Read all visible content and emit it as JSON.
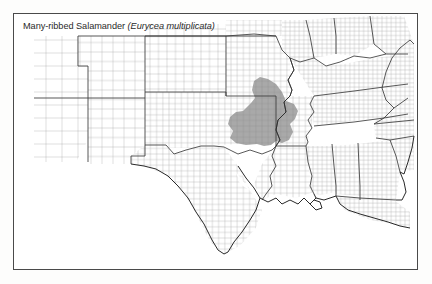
{
  "figure": {
    "caption_common": "Many-ribbed Salamander",
    "caption_scientific": "(Eurycea multiplicata)",
    "frame_color": "#4a4a4a",
    "background_color": "#ffffff"
  },
  "map": {
    "type": "species-range-map",
    "region": "south-central and southeastern United States",
    "county_fill": "#ffffff",
    "county_stroke": "#9a9a9a",
    "state_stroke": "#3a3a3a",
    "coast_stroke": "#1e1e1e",
    "range_fill": "#a9a9a9",
    "range_description": "Eastern Oklahoma and western / central Arkansas (Ouachita and Ozark uplands), north to southern Missouri, south to the Red River",
    "states_shaded": [
      "Oklahoma",
      "Arkansas",
      "Missouri",
      "Kansas"
    ]
  }
}
